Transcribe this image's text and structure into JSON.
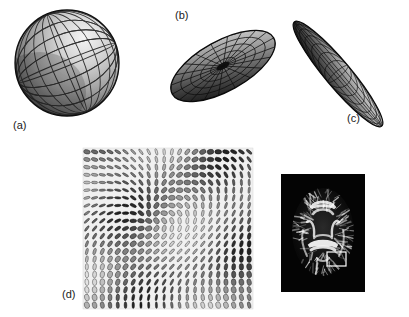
{
  "figure": {
    "background_color": "#ffffff",
    "width": 409,
    "height": 317
  },
  "panels": [
    {
      "id": "a",
      "label": "(a)",
      "label_x": 13,
      "label_y": 119,
      "glyph_type": "isotropic-sphere",
      "title_implied": "Isotropic (spherical) diffusion tensor glyph",
      "center_x": 67,
      "center_y": 63,
      "radius_x": 52,
      "radius_y": 53,
      "rotation_deg": 0,
      "mesh": {
        "meridians": 12,
        "parallels": 10,
        "line_color": "#2b2b2b",
        "line_width": 0.8
      },
      "shading": {
        "light_from": "upper-right",
        "highlight_color": "#f2f2f2",
        "mid_color": "#9a9a9a",
        "shadow_color": "#1f1f1f"
      }
    },
    {
      "id": "b",
      "label": "(b)",
      "label_x": 175,
      "label_y": 9,
      "glyph_type": "oblate-disc",
      "title_implied": "Oblate (planar) diffusion tensor glyph",
      "center_x": 223,
      "center_y": 66,
      "radius_x": 58,
      "radius_y": 25,
      "rotation_deg": -29,
      "mesh": {
        "meridians": 20,
        "parallels": 6,
        "line_color": "#111111",
        "line_width": 0.7
      },
      "shading": {
        "light_from": "upper-right",
        "highlight_color": "#cfcfcf",
        "mid_color": "#6e6e6e",
        "shadow_color": "#141414"
      }
    },
    {
      "id": "c",
      "label": "(c)",
      "label_x": 347,
      "label_y": 112,
      "glyph_type": "prolate-cigar",
      "title_implied": "Prolate (linear) diffusion tensor glyph",
      "center_x": 338,
      "center_y": 74,
      "radius_x": 68,
      "radius_y": 13,
      "rotation_deg": 50,
      "mesh": {
        "meridians": 18,
        "parallels": 5,
        "line_color": "#111111",
        "line_width": 0.7
      },
      "shading": {
        "light_from": "upper-right",
        "highlight_color": "#d8d8d8",
        "mid_color": "#777777",
        "shadow_color": "#101010"
      }
    },
    {
      "id": "d",
      "label": "(d)",
      "label_x": 62,
      "label_y": 288,
      "glyph_type": "tensor-glyph-field",
      "title_implied": "Field of tensor glyphs over a brain region of interest",
      "x": 83,
      "y": 148,
      "width": 170,
      "height": 161,
      "grid_cols": 22,
      "grid_rows": 21,
      "background_color": "#f7f7f7"
    },
    {
      "id": "e",
      "label": "",
      "glyph_type": "dti-brain-slice",
      "title_implied": "Axial fractional anisotropy map with ROI box",
      "x": 281,
      "y": 174,
      "width": 84,
      "height": 118,
      "background_color": "#050505",
      "roi_box": {
        "x": 327,
        "y": 252,
        "width": 19,
        "height": 14,
        "color": "#ffffff",
        "line_width": 1.2
      }
    }
  ]
}
